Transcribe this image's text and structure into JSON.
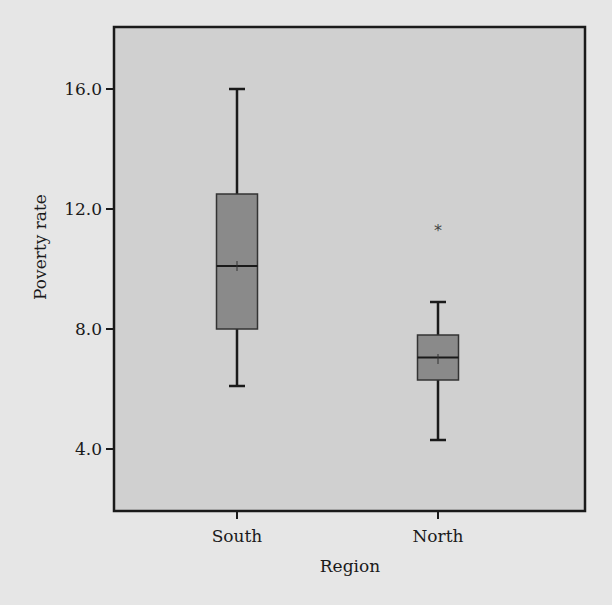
{
  "chart_data": {
    "type": "boxplot",
    "title": "",
    "xlabel": "Region",
    "ylabel": "Poverty rate",
    "ylim": [
      1.7,
      18.1
    ],
    "yticks": [
      4.0,
      8.0,
      12.0,
      16.0
    ],
    "ytick_labels": [
      "4.0",
      "8.0",
      "12.0",
      "16.0"
    ],
    "categories": [
      "South",
      "North"
    ],
    "grid": false,
    "legend": "none",
    "series": [
      {
        "name": "South",
        "whisker_low": 6.1,
        "q1": 8.0,
        "median": 10.1,
        "mean": 10.1,
        "q3": 12.5,
        "whisker_high": 16.0,
        "outliers": []
      },
      {
        "name": "North",
        "whisker_low": 4.3,
        "q1": 6.3,
        "median": 7.05,
        "mean": 7.0,
        "q3": 7.8,
        "whisker_high": 8.9,
        "outliers": [
          11.4
        ]
      }
    ],
    "outlier_marker": "*",
    "colors": {
      "background": "#e6e6e6",
      "plot_area": "#d0d0d0",
      "box_fill": "#8a8a8a",
      "line": "#1a1a1a"
    }
  }
}
